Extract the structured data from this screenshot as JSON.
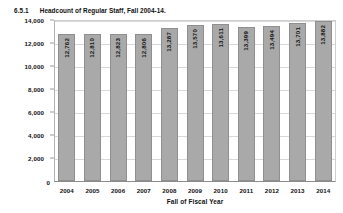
{
  "figure": {
    "number": "6.5.1",
    "title": "Headcount of Regular Staff, Fall 2004-14."
  },
  "colors": {
    "bar_fill": "#a9a9a9",
    "bar_border": "#8f8f8f",
    "gridline": "#d8d8d8",
    "axis": "#8c8c8c",
    "text": "#111111",
    "background": "#ffffff"
  },
  "chart_data": {
    "type": "bar",
    "title": "Headcount of Regular Staff, Fall 2004-14.",
    "xlabel": "Fall of Fiscal Year",
    "ylabel": "",
    "ylim": [
      0,
      14000
    ],
    "yticks": [
      "0",
      "2,000",
      "4,000",
      "6,000",
      "8,000",
      "10,000",
      "12,000",
      "14,000"
    ],
    "ytick_values": [
      0,
      2000,
      4000,
      6000,
      8000,
      10000,
      12000,
      14000
    ],
    "grid": true,
    "legend": "none",
    "categories": [
      "2004",
      "2005",
      "2006",
      "2007",
      "2008",
      "2009",
      "2010",
      "2011",
      "2012",
      "2013",
      "2014"
    ],
    "values": [
      12762,
      12810,
      12823,
      12806,
      13287,
      13570,
      13611,
      13399,
      13494,
      13701,
      13882
    ],
    "value_labels": [
      "12,762",
      "12,810",
      "12,823",
      "12,806",
      "13,287",
      "13,570",
      "13,611",
      "13,399",
      "13,494",
      "13,701",
      "13,882"
    ]
  }
}
